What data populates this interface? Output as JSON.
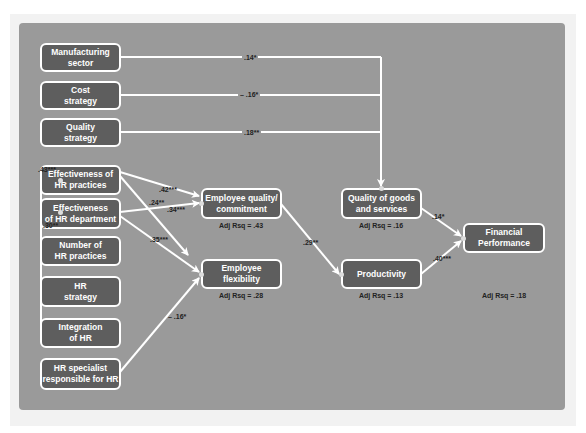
{
  "diagram": {
    "type": "path-model",
    "colors": {
      "panel": "#9a9a9a",
      "box_fill": "#5e5e5e",
      "box_border": "#ffffff",
      "arrow": "#ffffff",
      "label_text": "#222222"
    },
    "nodes": {
      "manufacturing_sector": "Manufacturing\nsector",
      "cost_strategy": "Cost\nstrategy",
      "quality_strategy": "Quality\nstrategy",
      "effectiveness_hr_practices": "Effectiveness of\nHR practices",
      "effectiveness_hr_department": "Effectiveness\nof HR department",
      "number_hr_practices": "Number of\nHR practices",
      "hr_strategy": "HR\nstrategy",
      "integration_hr": "Integration\nof HR",
      "hr_specialist": "HR specialist\nresponsible for HR",
      "employee_quality": "Employee quality/\ncommitment",
      "employee_flexibility": "Employee\nflexibility",
      "quality_goods": "Quality of goods\nand services",
      "productivity": "Productivity",
      "financial_performance": "Financial\nPerformance"
    },
    "rsq": {
      "employee_quality": "Adj Rsq = .43",
      "employee_flexibility": "Adj Rsq = .28",
      "quality_goods": "Adj Rsq = .16",
      "productivity": "Adj Rsq = .13",
      "financial_performance": "Adj Rsq = .18"
    },
    "edges": {
      "manufacturing_to_quality_goods": ".14*",
      "cost_to_quality_goods": "– .16*",
      "quality_strategy_to_quality_goods": ".18**",
      "integration_to_eff_practices": ".43***",
      "integration_to_eff_department": ".30**",
      "eff_practices_to_employee_quality": ".42***",
      "eff_practices_to_employee_flexibility": ".24**",
      "eff_department_to_employee_quality": ".34***",
      "eff_department_to_employee_flexibility": ".35***",
      "hr_specialist_to_employee_flexibility": "– .16*",
      "employee_quality_to_productivity": ".29**",
      "quality_goods_to_financial": ".14*",
      "productivity_to_financial": ".40***"
    }
  }
}
